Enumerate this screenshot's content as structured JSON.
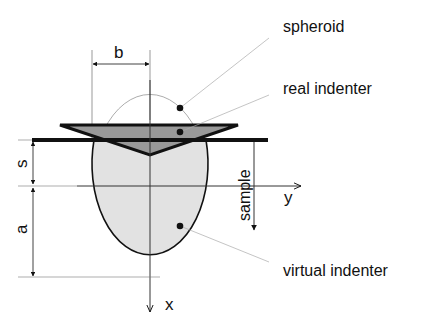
{
  "diagram": {
    "labels": {
      "spheroid": "spheroid",
      "real_indenter": "real indenter",
      "virtual_indenter": "virtual indenter",
      "sample": "sample"
    },
    "dimensions": {
      "b": "b",
      "s": "s",
      "a": "a"
    },
    "axes": {
      "x": "x",
      "y": "y"
    },
    "colors": {
      "line": "#111111",
      "thin_line": "#555555",
      "leader": "#aaaaaa",
      "indenter_fill": "#999999",
      "spheroid_fill": "#e2e2e2",
      "background": "#ffffff"
    }
  }
}
